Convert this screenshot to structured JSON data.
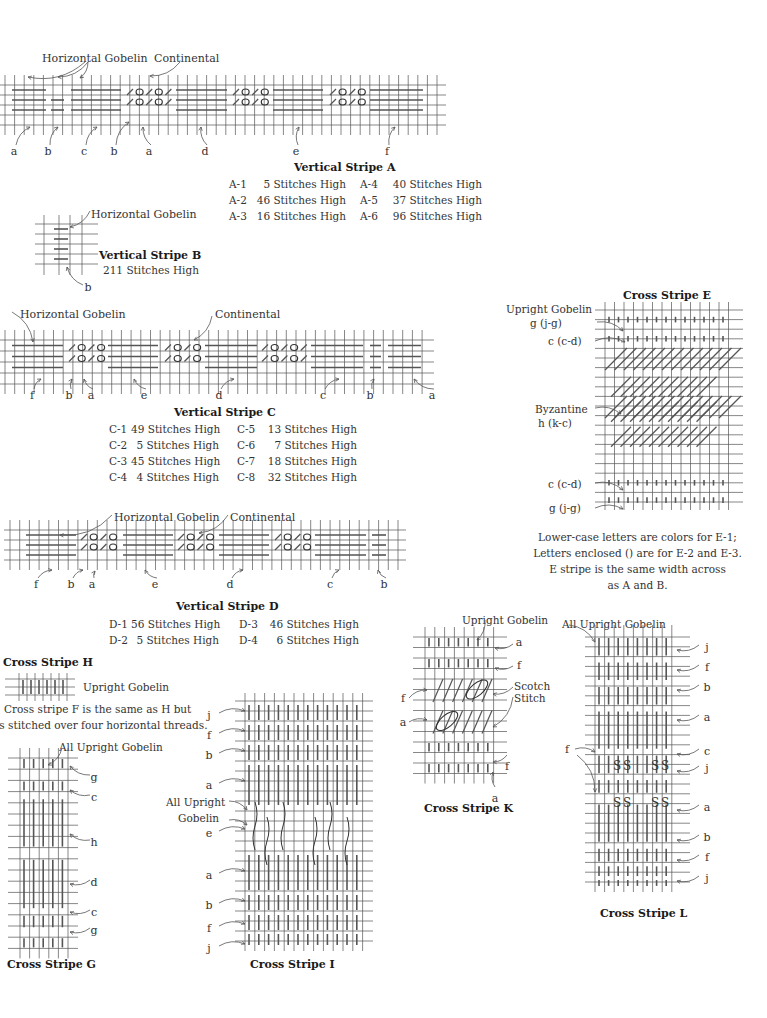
{
  "vertical_stripe_a": {
    "title": "Vertical Stripe A",
    "callouts": [
      "Horizontal Gobelin",
      "Continental"
    ],
    "color_labels": [
      "a",
      "b",
      "c",
      "b",
      "a",
      "d",
      "e",
      "f"
    ],
    "specs": [
      {
        "code": "A-1",
        "value": "5 Stitches High"
      },
      {
        "code": "A-2",
        "value": "46 Stitches High"
      },
      {
        "code": "A-3",
        "value": "16 Stitches High"
      },
      {
        "code": "A-4",
        "value": "40 Stitches High"
      },
      {
        "code": "A-5",
        "value": "37 Stitches High"
      },
      {
        "code": "A-6",
        "value": "96 Stitches High"
      }
    ]
  },
  "vertical_stripe_b": {
    "title": "Vertical Stripe B",
    "subtitle": "211 Stitches High",
    "callout": "Horizontal Gobelin",
    "color_labels": [
      "b"
    ]
  },
  "vertical_stripe_c": {
    "title": "Vertical Stripe C",
    "callouts": [
      "Horizontal Gobelin",
      "Continental"
    ],
    "color_labels": [
      "f",
      "b",
      "a",
      "e",
      "d",
      "c",
      "b",
      "a"
    ],
    "specs": [
      {
        "code": "C-1",
        "value": "49 Stitches High"
      },
      {
        "code": "C-2",
        "value": "5 Stitches High"
      },
      {
        "code": "C-3",
        "value": "45 Stitches High"
      },
      {
        "code": "C-4",
        "value": "4 Stitches High"
      },
      {
        "code": "C-5",
        "value": "13 Stitches High"
      },
      {
        "code": "C-6",
        "value": "7 Stitches High"
      },
      {
        "code": "C-7",
        "value": "18 Stitches High"
      },
      {
        "code": "C-8",
        "value": "32 Stitches High"
      }
    ]
  },
  "vertical_stripe_d": {
    "title": "Vertical Stripe D",
    "callouts": [
      "Horizontal Gobelin",
      "Continental"
    ],
    "color_labels": [
      "f",
      "b",
      "a",
      "e",
      "d",
      "c",
      "b"
    ],
    "specs": [
      {
        "code": "D-1",
        "value": "56 Stitches High"
      },
      {
        "code": "D-2",
        "value": "5 Stitches High"
      },
      {
        "code": "D-3",
        "value": "46 Stitches High"
      },
      {
        "code": "D-4",
        "value": "6 Stitches High"
      }
    ]
  },
  "cross_stripe_e": {
    "title": "Cross Stripe E",
    "labels": [
      {
        "line1": "Upright Gobelin",
        "line2": "g (j-g)"
      },
      {
        "line1": "c (c-d)",
        "line2": ""
      },
      {
        "line1": "Byzantine",
        "line2": "h (k-c)"
      },
      {
        "line1": "c (c-d)",
        "line2": ""
      },
      {
        "line1": "g (j-g)",
        "line2": ""
      }
    ],
    "notes": [
      "Lower-case letters are colors for E-1;",
      "Letters enclosed () are for E-2 and E-3.",
      "E stripe is the same width across",
      "as A and B."
    ]
  },
  "cross_stripe_h": {
    "title": "Cross Stripe H",
    "callout": "Upright Gobelin",
    "note_lines": [
      "Cross stripe F is the same as H but",
      "is stitched over four horizontal threads."
    ]
  },
  "cross_stripe_g": {
    "title": "Cross Stripe G",
    "callout": "All Upright Gobelin",
    "color_labels": [
      "g",
      "c",
      "h",
      "d",
      "c",
      "g"
    ]
  },
  "cross_stripe_i": {
    "title": "Cross Stripe I",
    "callout_line1": "All Upright",
    "callout_line2": "Gobelin",
    "color_labels": [
      "j",
      "f",
      "b",
      "a",
      "e",
      "a",
      "b",
      "f",
      "j"
    ]
  },
  "cross_stripe_k": {
    "title": "Cross Stripe K",
    "callouts": [
      "Upright Gobelin",
      "Scotch",
      "Stitch"
    ],
    "color_labels_right": [
      "a",
      "f",
      "f",
      "a"
    ],
    "color_labels_left": [
      "f",
      "a"
    ]
  },
  "cross_stripe_l": {
    "title": "Cross Stripe L",
    "callout": "All Upright Gobelin",
    "color_labels_right": [
      "j",
      "f",
      "b",
      "a",
      "c",
      "j",
      "a",
      "b",
      "f",
      "j"
    ],
    "color_label_left": "f"
  }
}
